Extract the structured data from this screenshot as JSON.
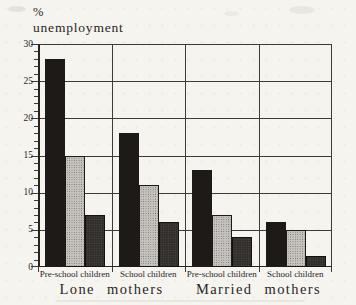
{
  "figure": {
    "paper_color": "#f6f4ef",
    "ink_color": "#29251f",
    "grid_color": "#3d3b38"
  },
  "chart_data": {
    "type": "bar",
    "title": "% unemployment",
    "axis_title_lines": [
      "%",
      "unemployment"
    ],
    "ylabel": "% unemployment",
    "xlabel": "",
    "ylim": [
      0,
      30
    ],
    "yticks": [
      0,
      5,
      10,
      15,
      20,
      25,
      30
    ],
    "minor_tick_step": 1,
    "grid": true,
    "legend": "none",
    "categories": [
      "Pre-school children",
      "School children",
      "Pre-school children",
      "School children"
    ],
    "category_groups": [
      {
        "label": "Lone mothers",
        "categories": [
          0,
          1
        ]
      },
      {
        "label": "Married mothers",
        "categories": [
          2,
          3
        ]
      }
    ],
    "series": [
      {
        "name": "bar-solid-black",
        "fill": "solid-black",
        "color": "#1d1a18",
        "values": [
          28,
          18,
          13,
          6
        ]
      },
      {
        "name": "bar-light-stipple",
        "fill": "stipple-light",
        "color": "#c6c3be",
        "values": [
          15,
          11,
          7,
          5
        ]
      },
      {
        "name": "bar-dark-stipple",
        "fill": "stipple-dark",
        "color": "#332f2c",
        "values": [
          7,
          6,
          4,
          1.5
        ]
      }
    ]
  }
}
